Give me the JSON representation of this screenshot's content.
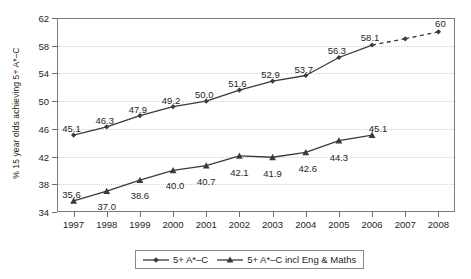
{
  "chart_data": {
    "type": "line",
    "title": "",
    "xlabel": "",
    "ylabel": "% 15 year olds achieving 5+ A*–C",
    "categories": [
      "1997",
      "1998",
      "1999",
      "2000",
      "2001",
      "2002",
      "2003",
      "2004",
      "2005",
      "2006",
      "2007",
      "2008"
    ],
    "ylim": [
      34,
      62
    ],
    "yticks": [
      34,
      38,
      42,
      46,
      50,
      54,
      58,
      62
    ],
    "grid": true,
    "legend_position": "bottom",
    "series": [
      {
        "name": "5+ A*–C",
        "marker": "diamond",
        "values": [
          45.1,
          46.3,
          47.9,
          49.2,
          50.0,
          51.6,
          52.9,
          53.7,
          56.3,
          58.1,
          59.0,
          60.0
        ],
        "labels": [
          "45.1",
          "46.3",
          "47.9",
          "49.2",
          "50.0",
          "51.6",
          "52.9",
          "53.7",
          "56.3",
          "58.1",
          "",
          "60"
        ],
        "projected_from_index": 9
      },
      {
        "name": "5+ A*–C incl Eng & Maths",
        "marker": "triangle",
        "values": [
          35.6,
          37.0,
          38.6,
          40.0,
          40.7,
          42.1,
          41.9,
          42.6,
          44.3,
          45.1,
          null,
          null
        ],
        "labels": [
          "35.6",
          "37.0",
          "38.6",
          "40.0",
          "40.7",
          "42.1",
          "41.9",
          "42.6",
          "44.3",
          "45.1",
          "",
          ""
        ]
      }
    ]
  },
  "legend": {
    "items": [
      {
        "label": "5+ A*–C",
        "marker": "diamond"
      },
      {
        "label": "5+ A*–C incl Eng & Maths",
        "marker": "triangle"
      }
    ]
  },
  "colors": {
    "line": "#3a3a3a",
    "axis": "#7d7d7d",
    "grid": "#cfcfcf",
    "text": "#231f20"
  }
}
